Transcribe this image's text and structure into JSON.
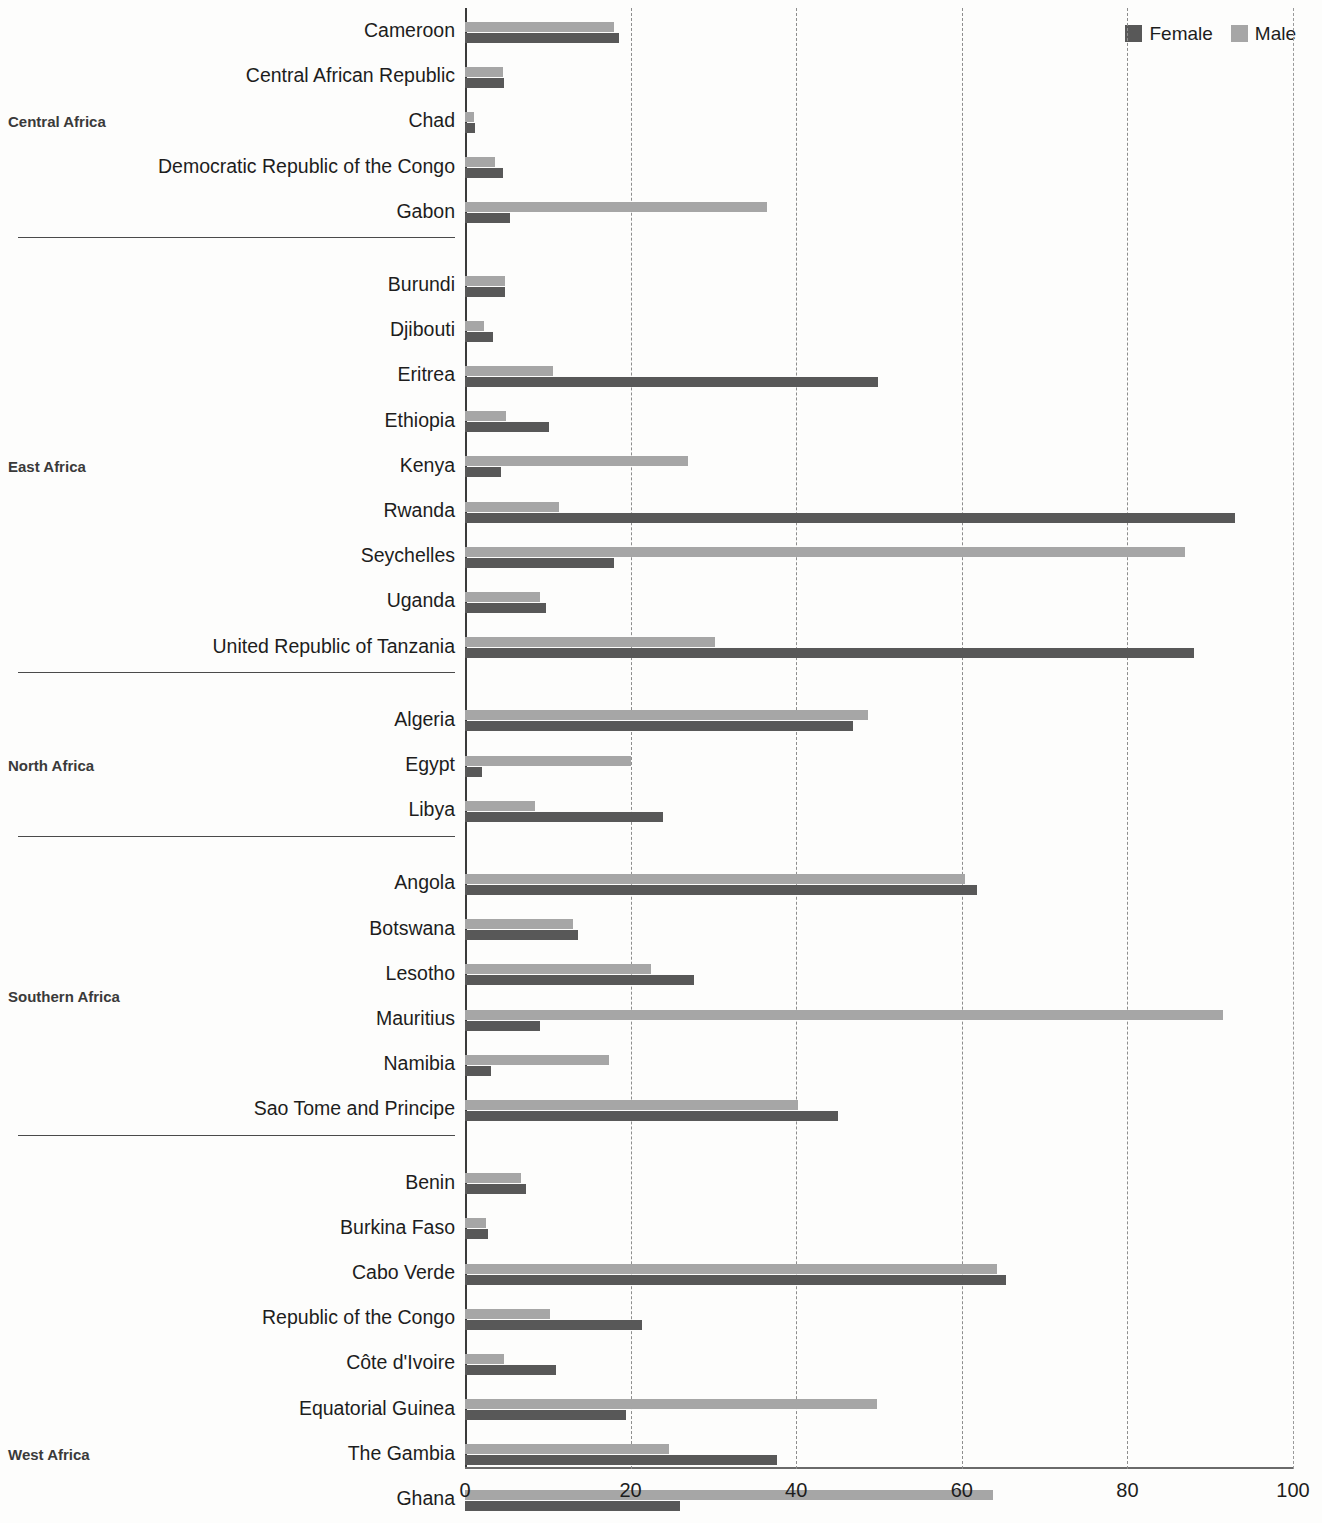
{
  "legend": {
    "entries": [
      {
        "label": "Female",
        "color": "#585858"
      },
      {
        "label": "Male",
        "color": "#a6a6a6"
      }
    ]
  },
  "axis": {
    "x_ticks": [
      "0",
      "20",
      "40",
      "60",
      "80",
      "100"
    ],
    "x_tick_values": [
      0,
      20,
      40,
      60,
      80,
      100
    ],
    "xmin": 0,
    "xmax": 100
  },
  "regions": [
    {
      "label": "Central Africa",
      "count": 5
    },
    {
      "label": "East Africa",
      "count": 9
    },
    {
      "label": "North Africa",
      "count": 3
    },
    {
      "label": "Southern Africa",
      "count": 6
    },
    {
      "label": "West Africa",
      "count": 13
    }
  ],
  "chart_data": {
    "type": "bar",
    "orientation": "horizontal",
    "title": "",
    "xlabel": "",
    "ylabel": "",
    "xlim": [
      0,
      100
    ],
    "grid": "vertical-dashed",
    "legend_position": "top-right",
    "groups": [
      {
        "group": "Central Africa",
        "categories": [
          "Cameroon",
          "Central African Republic",
          "Chad",
          "Democratic Republic of the Congo",
          "Gabon"
        ],
        "series": [
          {
            "name": "Female",
            "values": [
              18.6,
              4.7,
              1.2,
              4.6,
              5.4
            ]
          },
          {
            "name": "Male",
            "values": [
              18.0,
              4.6,
              1.1,
              3.6,
              36.5
            ]
          }
        ]
      },
      {
        "group": "East Africa",
        "categories": [
          "Burundi",
          "Djibouti",
          "Eritrea",
          "Ethiopia",
          "Kenya",
          "Rwanda",
          "Seychelles",
          "Uganda",
          "United Republic of Tanzania"
        ],
        "series": [
          {
            "name": "Female",
            "values": [
              4.8,
              3.4,
              49.9,
              10.2,
              4.3,
              93.0,
              18.0,
              9.8,
              88.0
            ]
          },
          {
            "name": "Male",
            "values": [
              4.8,
              2.3,
              10.6,
              5.0,
              26.9,
              11.4,
              87.0,
              9.0,
              30.2
            ]
          }
        ]
      },
      {
        "group": "North Africa",
        "categories": [
          "Algeria",
          "Egypt",
          "Libya"
        ],
        "series": [
          {
            "name": "Female",
            "values": [
              46.8,
              2.1,
              23.9
            ]
          },
          {
            "name": "Male",
            "values": [
              48.7,
              20.0,
              8.5
            ]
          }
        ]
      },
      {
        "group": "Southern Africa",
        "categories": [
          "Angola",
          "Botswana",
          "Lesotho",
          "Mauritius",
          "Namibia",
          "Sao Tome and Principe"
        ],
        "series": [
          {
            "name": "Female",
            "values": [
              61.8,
              13.6,
              27.6,
              9.0,
              3.2,
              45.0
            ]
          },
          {
            "name": "Male",
            "values": [
              60.4,
              13.0,
              22.5,
              91.6,
              17.4,
              40.2
            ]
          }
        ]
      },
      {
        "group": "West Africa",
        "categories": [
          "Benin",
          "Burkina Faso",
          "Cabo Verde",
          "Republic of the Congo",
          "Côte d'Ivoire",
          "Equatorial Guinea",
          "The Gambia",
          "Ghana",
          "Guinea",
          "Guinea-Bissau",
          "Mali",
          "Sierra Leone",
          "Togo"
        ],
        "series": [
          {
            "name": "Female",
            "values": [
              7.4,
              2.8,
              65.3,
              21.4,
              11.0,
              19.5,
              37.7,
              26.0,
              66.0,
              7.2,
              8.2,
              3.0,
              43.2
            ]
          },
          {
            "name": "Male",
            "values": [
              6.8,
              2.5,
              64.2,
              10.3,
              4.7,
              49.7,
              24.6,
              63.8,
              7.6,
              4.4,
              3.1,
              7.0,
              9.0
            ]
          }
        ]
      }
    ]
  }
}
